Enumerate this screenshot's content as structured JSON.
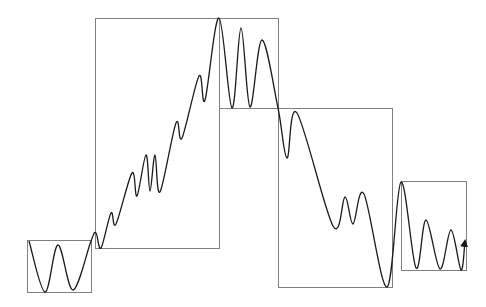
{
  "diagram": {
    "title": "",
    "background": "#ffffff",
    "box_stroke": "#808080",
    "curve_stroke": "#1a1a1a",
    "boxes": [
      {
        "name": "segment-box-1",
        "x": 27,
        "y": 240,
        "w": 64,
        "h": 52
      },
      {
        "name": "segment-box-2",
        "x": 95,
        "y": 18,
        "w": 124,
        "h": 230
      },
      {
        "name": "segment-box-3",
        "x": 219,
        "y": 18,
        "w": 59,
        "h": 90
      },
      {
        "name": "segment-box-4",
        "x": 278,
        "y": 108,
        "w": 114,
        "h": 179
      },
      {
        "name": "segment-box-5",
        "x": 401,
        "y": 181,
        "w": 65,
        "h": 89
      }
    ],
    "curve_points": [
      [
        29,
        241
      ],
      [
        45,
        292
      ],
      [
        58,
        245
      ],
      [
        73,
        290
      ],
      [
        91,
        241
      ],
      [
        96,
        233
      ],
      [
        101,
        248
      ],
      [
        111,
        213
      ],
      [
        116,
        224
      ],
      [
        132,
        173
      ],
      [
        137,
        196
      ],
      [
        146,
        155
      ],
      [
        150,
        191
      ],
      [
        155,
        155
      ],
      [
        160,
        192
      ],
      [
        176,
        123
      ],
      [
        182,
        138
      ],
      [
        199,
        76
      ],
      [
        205,
        100
      ],
      [
        219,
        18
      ],
      [
        232,
        108
      ],
      [
        241,
        28
      ],
      [
        250,
        107
      ],
      [
        262,
        40
      ],
      [
        278,
        108
      ],
      [
        287,
        158
      ],
      [
        297,
        113
      ],
      [
        333,
        226
      ],
      [
        345,
        197
      ],
      [
        353,
        224
      ],
      [
        364,
        194
      ],
      [
        387,
        287
      ],
      [
        401,
        182
      ],
      [
        416,
        268
      ],
      [
        426,
        220
      ],
      [
        440,
        269
      ],
      [
        451,
        230
      ],
      [
        461,
        270
      ],
      [
        465,
        241
      ]
    ],
    "arrow_tip": [
      465,
      241
    ]
  }
}
